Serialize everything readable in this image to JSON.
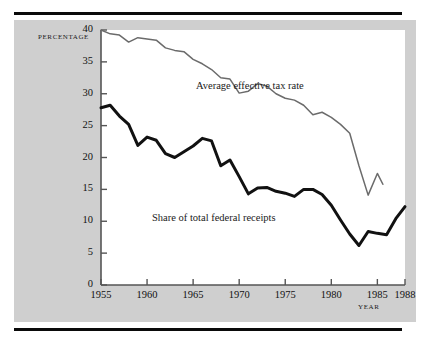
{
  "figure": {
    "axis_label_y": "PERCENTAGE",
    "axis_label_x": "YEAR",
    "ink_color": "#1a1a1a",
    "panel_color": "#cfcfcf",
    "plot_color": "#ffffff"
  },
  "chart_data": {
    "type": "line",
    "title": "",
    "subtitle": "",
    "xlabel": "YEAR",
    "ylabel": "PERCENTAGE",
    "xlim": [
      1955,
      1988
    ],
    "ylim": [
      0,
      40
    ],
    "grid": false,
    "legend_position": "inline-annotations",
    "yticks": [
      0,
      5,
      10,
      15,
      20,
      25,
      30,
      35,
      40
    ],
    "ytick_labels": [
      "0",
      "5",
      "10",
      "15",
      "20",
      "25",
      "30",
      "35",
      "40"
    ],
    "xticks": [
      1955,
      1960,
      1965,
      1970,
      1975,
      1980,
      1985,
      1988
    ],
    "xtick_labels": [
      "1955",
      "1960",
      "1965",
      "1970",
      "1975",
      "1980",
      "1985",
      "1988"
    ],
    "annotations": [
      {
        "text": "Average effective tax rate",
        "x": 1971,
        "y": 34.5
      },
      {
        "text": "Share of total federal receipts",
        "x": 1966.5,
        "y": 11.8
      }
    ],
    "series": [
      {
        "name": "Average effective tax rate",
        "color": "#6b6b6b",
        "width": 1.5,
        "x": [
          1955,
          1956,
          1957,
          1958,
          1959,
          1960,
          1961,
          1962,
          1963,
          1964,
          1965,
          1966,
          1967,
          1968,
          1969,
          1970,
          1971,
          1972,
          1973,
          1974,
          1975,
          1976,
          1977,
          1978,
          1979,
          1980,
          1981,
          1982,
          1983,
          1984,
          1985
        ],
        "values": [
          40.0,
          39.4,
          39.2,
          38.1,
          38.8,
          38.6,
          38.4,
          37.2,
          36.8,
          36.6,
          35.4,
          34.7,
          33.8,
          32.5,
          32.3,
          30.1,
          30.4,
          31.6,
          31.2,
          30.0,
          29.3,
          29.0,
          28.2,
          26.7,
          27.1,
          26.3,
          25.2,
          23.8,
          18.7,
          14.1,
          17.5
        ],
        "values_end_note": "series ends 1985 at 15.8",
        "final_value": 15.8
      },
      {
        "name": "Share of total federal receipts",
        "color": "#111111",
        "width": 3,
        "x": [
          1955,
          1956,
          1957,
          1958,
          1959,
          1960,
          1961,
          1962,
          1963,
          1964,
          1965,
          1966,
          1967,
          1968,
          1969,
          1970,
          1971,
          1972,
          1973,
          1974,
          1975,
          1976,
          1977,
          1978,
          1979,
          1980,
          1981,
          1982,
          1983,
          1984,
          1985,
          1986,
          1987,
          1988
        ],
        "values": [
          27.8,
          28.2,
          26.5,
          25.2,
          21.9,
          23.2,
          22.7,
          20.6,
          20.0,
          20.9,
          21.8,
          23.0,
          22.6,
          18.7,
          19.6,
          17.0,
          14.3,
          15.2,
          15.3,
          14.7,
          14.4,
          13.9,
          15.0,
          15.0,
          14.2,
          12.5,
          10.2,
          8.0,
          6.2,
          8.4,
          8.1,
          7.9,
          10.4,
          12.3
        ]
      }
    ]
  }
}
